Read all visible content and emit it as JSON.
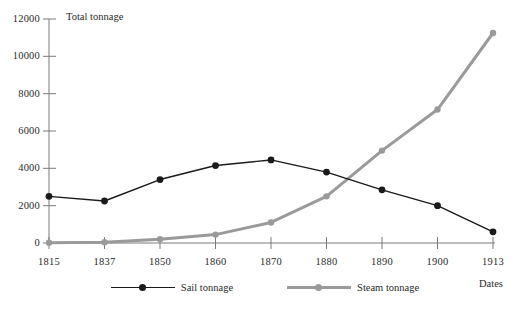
{
  "chart_data": {
    "type": "line",
    "title": "",
    "xlabel": "Dates",
    "ylabel": "Total tonnage",
    "x": [
      "1815",
      "1837",
      "1850",
      "1860",
      "1870",
      "1880",
      "1890",
      "1900",
      "1913"
    ],
    "categories": [
      "1815",
      "1837",
      "1850",
      "1860",
      "1870",
      "1880",
      "1890",
      "1900",
      "1913"
    ],
    "series": [
      {
        "name": "Sail tonnage",
        "color": "#1a1a1a",
        "values": [
          2500,
          2250,
          3400,
          4150,
          4450,
          3800,
          2850,
          2000,
          600
        ]
      },
      {
        "name": "Steam tonnage",
        "color": "#9a9a9a",
        "values": [
          20,
          40,
          200,
          450,
          1100,
          2500,
          4950,
          7150,
          11250
        ]
      }
    ],
    "ylim": [
      0,
      12000
    ],
    "yticks": [
      0,
      2000,
      4000,
      6000,
      8000,
      10000,
      12000
    ],
    "ytick_labels": [
      "0",
      "2000",
      "4000",
      "6000",
      "8000",
      "10000",
      "12000"
    ],
    "grid": false,
    "legend_position": "bottom"
  },
  "axes": {
    "y_title": "Total tonnage",
    "x_title": "Dates",
    "y_ticks": [
      "12000",
      "10000",
      "8000",
      "6000",
      "4000",
      "2000",
      "0"
    ],
    "x_ticks": [
      "1815",
      "1837",
      "1850",
      "1860",
      "1870",
      "1880",
      "1890",
      "1900",
      "1913"
    ],
    "axis_color": "#777777"
  },
  "legend": {
    "items": [
      {
        "label": "Sail tonnage",
        "color": "#1a1a1a"
      },
      {
        "label": "Steam tonnage",
        "color": "#9a9a9a"
      }
    ]
  }
}
